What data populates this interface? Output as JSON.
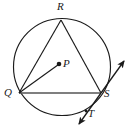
{
  "figure": {
    "stroke_color": "#1a1a1a",
    "fill_color": "#ffffff",
    "width": 132,
    "height": 138
  },
  "labels": {
    "R": "R",
    "Q": "Q",
    "S": "S",
    "P": "P",
    "T": "T"
  },
  "geometry": {
    "circle": {
      "cx": 62,
      "cy": 67,
      "r": 48.5,
      "name": "circle-centered-at-P"
    },
    "center_point": {
      "x": 59,
      "y": 64,
      "name": "center-point-P"
    },
    "points": {
      "R": {
        "x": 61,
        "y": 20
      },
      "Q": {
        "x": 19,
        "y": 93
      },
      "S": {
        "x": 101,
        "y": 93
      },
      "T": {
        "x": 86,
        "y": 111
      }
    },
    "segments": [
      {
        "name": "segment-QR",
        "from": "Q",
        "to": "R"
      },
      {
        "name": "segment-RS",
        "from": "R",
        "to": "S"
      },
      {
        "name": "segment-QS",
        "from": "Q",
        "to": "S"
      },
      {
        "name": "segment-QP",
        "from": "Q",
        "to": "P"
      }
    ],
    "tangent_line": {
      "name": "tangent-line-at-S",
      "through": "S",
      "arrow_up_end": {
        "x": 126,
        "y": 59
      },
      "arrow_down_end": {
        "x": 77,
        "y": 126
      },
      "double_headed": true
    }
  }
}
